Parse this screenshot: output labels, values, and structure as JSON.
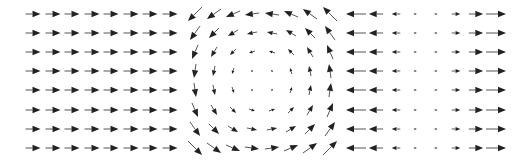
{
  "chart_data": [
    {
      "type": "quiver",
      "title": "",
      "field": "uniform",
      "description": "Uniform flow: u = 1, v = 0",
      "grid": {
        "nx": 8,
        "ny": 8
      },
      "x_pixels": [
        33,
        53,
        72,
        92,
        111,
        131,
        150,
        170
      ],
      "y_pixels": [
        14,
        33,
        52,
        71,
        90,
        110,
        129,
        148
      ],
      "u_expr": "1",
      "v_expr": "0",
      "scale_px": 15,
      "axes_visible": false
    },
    {
      "type": "quiver",
      "title": "",
      "field": "rotation",
      "description": "Counterclockwise rotation: u = -y, v = x",
      "grid": {
        "nx": 8,
        "ny": 8
      },
      "x_pixels": [
        195,
        214,
        233,
        252,
        272,
        291,
        310,
        330
      ],
      "y_pixels": [
        14,
        33,
        52,
        71,
        90,
        110,
        129,
        148
      ],
      "u_expr": "-y",
      "v_expr": "x",
      "scale_px": 20,
      "axes_visible": false
    },
    {
      "type": "quiver",
      "title": "",
      "field": "horizontal-divergence",
      "description": "Horizontal source: u = x, v = 0",
      "grid": {
        "nx": 8,
        "ny": 8
      },
      "x_pixels": [
        356,
        376,
        396,
        415,
        436,
        456,
        476,
        496
      ],
      "y_pixels": [
        14,
        33,
        52,
        71,
        90,
        110,
        129,
        148
      ],
      "u_expr": "x",
      "v_expr": "0",
      "scale_px": 20,
      "axes_visible": false
    }
  ],
  "colors": {
    "arrow_head": "#222222",
    "arrow_shaft": "#555555",
    "background": "#ffffff"
  }
}
